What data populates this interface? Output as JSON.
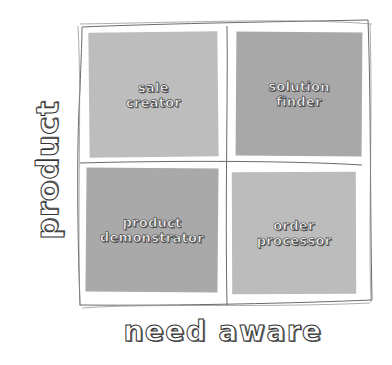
{
  "diagram": {
    "type": "2x2 matrix",
    "axes": {
      "y_label": "product",
      "x_label": "need aware"
    },
    "quadrants": [
      {
        "position": "top-left",
        "label": "sale\ncreator",
        "color": "#bdbdbd"
      },
      {
        "position": "top-right",
        "label": "solution\nfinder",
        "color": "#a8a8a8"
      },
      {
        "position": "bottom-left",
        "label": "product\ndemonstrator",
        "color": "#a9a9a9"
      },
      {
        "position": "bottom-right",
        "label": "order\nprocessor",
        "color": "#bcbcbc"
      }
    ],
    "colors": {
      "background": "#ffffff",
      "frame_stroke": "#6a6a6a",
      "label_fill": "#f4f4f4",
      "label_outline": "#444444"
    }
  }
}
